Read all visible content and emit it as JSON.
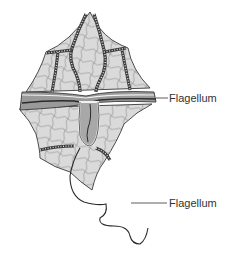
{
  "diagram": {
    "labels": [
      {
        "text": "Flagellum",
        "target": "transverse-flagellum"
      },
      {
        "text": "Flagellum",
        "target": "longitudinal-flagellum"
      }
    ],
    "colors": {
      "background": "#ffffff",
      "cell_fill": "#d9d9d9",
      "plate_lines": "#6e6e6e",
      "outline": "#3a3a3a",
      "girdle_fill": "#9a9a9a",
      "sulcus_fill": "#a8a8a8",
      "flagellum": "#2a2a2a",
      "label_text": "#333333"
    }
  }
}
